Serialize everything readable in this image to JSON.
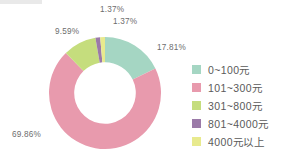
{
  "chart_data": {
    "type": "pie",
    "variant": "donut",
    "title": "",
    "subtitle": "",
    "xlabel": "",
    "ylabel": "",
    "grid": false,
    "legend_position": "right",
    "start_angle_deg": 0,
    "direction": "clockwise",
    "inner_radius_ratio": 0.55,
    "categories": [
      "0~100元",
      "101~300元",
      "301~800元",
      "801~4000元",
      "4000元以上"
    ],
    "values": [
      17.81,
      69.86,
      9.59,
      1.37,
      1.37
    ],
    "value_labels": [
      "17.81%",
      "69.86%",
      "9.59%",
      "1.37%",
      "1.37%"
    ],
    "colors": [
      "#a5d6c3",
      "#e89aad",
      "#c5dd7d",
      "#9b7aa8",
      "#e8ea8e"
    ],
    "units": "%"
  },
  "labels": {
    "slice_0": "17.81%",
    "slice_1": "69.86%",
    "slice_2": "9.59%",
    "slice_3": "1.37%",
    "slice_4": "1.37%"
  },
  "legend": {
    "items": [
      {
        "label": "0~100元",
        "color": "#a5d6c3"
      },
      {
        "label": "101~300元",
        "color": "#e89aad"
      },
      {
        "label": "301~800元",
        "color": "#c5dd7d"
      },
      {
        "label": "801~4000元",
        "color": "#9b7aa8"
      },
      {
        "label": "4000元以上",
        "color": "#e8ea8e"
      }
    ]
  },
  "theme": {
    "background": "#ffffff",
    "label_color": "#6d6d6d",
    "legend_text_color": "#5a5a5a"
  }
}
